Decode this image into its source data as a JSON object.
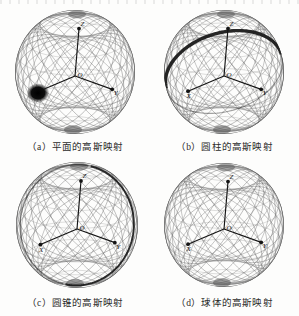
{
  "figure": {
    "title_fragment_top": "",
    "background_color": "#fdfdfc",
    "wire_color": "#6f6f6f",
    "mark_color": "#1a1a1a",
    "axis_color": "#141414",
    "width": 299,
    "height": 316
  },
  "panels": [
    {
      "id": "a",
      "caption": "（a）平面的高斯映射",
      "subject": "plane",
      "gauss_image": "single-point",
      "sphere": {
        "cx": 75,
        "cy": 72,
        "rx": 60,
        "ry": 62
      },
      "axes": [
        {
          "label": "Z",
          "dir": "up"
        },
        {
          "label": "X",
          "dir": "left-front"
        },
        {
          "label": "Y",
          "dir": "right-front"
        }
      ],
      "mark": {
        "type": "dot",
        "cx": 38,
        "cy": 93,
        "rx": 11,
        "ry": 9.5
      }
    },
    {
      "id": "b",
      "caption": "（b）圆柱的高斯映射",
      "subject": "cylinder",
      "gauss_image": "great-circle-arc",
      "sphere": {
        "cx": 224,
        "cy": 72,
        "rx": 60,
        "ry": 62
      },
      "axes": [
        {
          "label": "Z",
          "dir": "up"
        },
        {
          "label": "X",
          "dir": "left-front"
        },
        {
          "label": "Y",
          "dir": "right-front"
        }
      ],
      "mark": {
        "type": "arc",
        "description": "thick dark great-circle over upper right"
      }
    },
    {
      "id": "c",
      "caption": "（c）圆锥的高斯映射",
      "subject": "cone",
      "gauss_image": "small-circle",
      "sphere": {
        "cx": 77,
        "cy": 225,
        "rx": 61,
        "ry": 63
      },
      "axes": [
        {
          "label": "Z",
          "dir": "up"
        },
        {
          "label": "X",
          "dir": "left-front"
        },
        {
          "label": "Y",
          "dir": "right-front"
        }
      ],
      "mark": {
        "type": "circle",
        "description": "dark tilted circle across the sphere"
      }
    },
    {
      "id": "d",
      "caption": "（d）球体的高斯映射",
      "subject": "sphere",
      "gauss_image": "whole-sphere",
      "sphere": {
        "cx": 224,
        "cy": 225,
        "rx": 60,
        "ry": 62
      },
      "axes": [
        {
          "label": "Z",
          "dir": "up"
        },
        {
          "label": "X",
          "dir": "left-front"
        },
        {
          "label": "Y",
          "dir": "right-front"
        }
      ],
      "mark": {
        "type": "none",
        "description": "no highlighted curve"
      }
    }
  ],
  "captions": {
    "a": "（a）平面的高斯映射",
    "b": "（b）圆柱的高斯映射",
    "c": "（c）圆锥的高斯映射",
    "d": "（d）球体的高斯映射"
  },
  "axis_labels": {
    "z": "Z",
    "x": "X",
    "y": "Y",
    "origin": "O"
  }
}
